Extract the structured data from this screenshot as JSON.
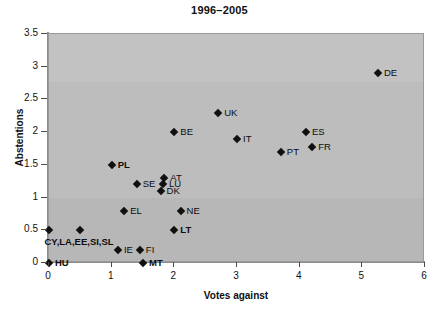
{
  "chart_data": {
    "type": "scatter",
    "title": "1996–2005",
    "xlabel": "Votes against",
    "ylabel": "Abstentions",
    "xlim": [
      0,
      6
    ],
    "ylim": [
      0,
      3.5
    ],
    "xticks": [
      "0",
      "1",
      "2",
      "3",
      "4",
      "5",
      "6"
    ],
    "yticks": [
      "0",
      "0.5",
      "1",
      "1.5",
      "2",
      "2.5",
      "3",
      "3.5"
    ],
    "grid": false,
    "legend": "none",
    "points": [
      {
        "label": "HU",
        "x": 0.0,
        "y": 0.0,
        "bold": true,
        "pos": "right"
      },
      {
        "label": "CY,LA,EE,SI,SL",
        "x": 0.0,
        "y": 0.5,
        "bold": true,
        "pos": "none"
      },
      {
        "label": "",
        "x": 0.5,
        "y": 0.5,
        "bold": false,
        "pos": "none"
      },
      {
        "label": "IE",
        "x": 1.1,
        "y": 0.2,
        "bold": false,
        "pos": "right"
      },
      {
        "label": "FI",
        "x": 1.45,
        "y": 0.2,
        "bold": false,
        "pos": "right"
      },
      {
        "label": "MT",
        "x": 1.5,
        "y": 0.0,
        "bold": true,
        "pos": "right"
      },
      {
        "label": "EL",
        "x": 1.2,
        "y": 0.8,
        "bold": false,
        "pos": "right"
      },
      {
        "label": "LT",
        "x": 2.0,
        "y": 0.5,
        "bold": true,
        "pos": "right"
      },
      {
        "label": "NE",
        "x": 2.1,
        "y": 0.8,
        "bold": false,
        "pos": "right"
      },
      {
        "label": "SE",
        "x": 1.4,
        "y": 1.2,
        "bold": false,
        "pos": "right"
      },
      {
        "label": "DK",
        "x": 1.78,
        "y": 1.1,
        "bold": false,
        "pos": "right"
      },
      {
        "label": "LU",
        "x": 1.82,
        "y": 1.2,
        "bold": false,
        "pos": "right"
      },
      {
        "label": "AT",
        "x": 1.84,
        "y": 1.3,
        "bold": false,
        "pos": "right"
      },
      {
        "label": "PL",
        "x": 1.0,
        "y": 1.5,
        "bold": true,
        "pos": "right"
      },
      {
        "label": "BE",
        "x": 2.0,
        "y": 2.0,
        "bold": false,
        "pos": "right"
      },
      {
        "label": "UK",
        "x": 2.7,
        "y": 2.3,
        "bold": false,
        "pos": "right"
      },
      {
        "label": "IT",
        "x": 3.0,
        "y": 1.9,
        "bold": false,
        "pos": "right"
      },
      {
        "label": "PT",
        "x": 3.7,
        "y": 1.7,
        "bold": false,
        "pos": "right"
      },
      {
        "label": "ES",
        "x": 4.1,
        "y": 2.0,
        "bold": false,
        "pos": "right"
      },
      {
        "label": "FR",
        "x": 4.2,
        "y": 1.78,
        "bold": false,
        "pos": "right"
      },
      {
        "label": "DE",
        "x": 5.25,
        "y": 2.9,
        "bold": false,
        "pos": "right"
      }
    ],
    "group_label": {
      "text": "CY,LA,EE,SI,SL",
      "x": 0.48,
      "y": 0.34
    },
    "colors": {
      "plot_background": "#bdbdbd",
      "marker": "#101010",
      "text": "#0d0d0d",
      "axis": "#8b8b8b"
    }
  },
  "caption": {
    "faint_text": ""
  }
}
